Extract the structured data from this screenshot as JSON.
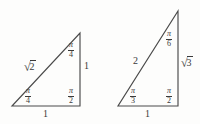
{
  "figure": {
    "background_color": "#fdfdfc",
    "stroke_color": "#4a4a4a",
    "text_color": "#3a3a3a"
  },
  "triangles": [
    {
      "name": "isosceles-right-triangle",
      "vertices": {
        "bottom_left": [
          12,
          106
        ],
        "bottom_right": [
          80,
          106
        ],
        "apex": [
          80,
          33
        ]
      },
      "angles": [
        {
          "name": "bottom-left-angle",
          "pi": "π",
          "denominator": "4"
        },
        {
          "name": "bottom-right-angle",
          "pi": "π",
          "denominator": "2"
        },
        {
          "name": "apex-angle",
          "pi": "π",
          "denominator": "4"
        }
      ],
      "sides": {
        "hypotenuse": {
          "surd": "√",
          "radicand": "2"
        },
        "vertical_leg": "1",
        "base": "1"
      }
    },
    {
      "name": "thirty-sixty-ninety-triangle",
      "vertices": {
        "bottom_left": [
          118,
          106
        ],
        "bottom_right": [
          178,
          106
        ],
        "apex": [
          178,
          11
        ]
      },
      "angles": [
        {
          "name": "bottom-left-angle",
          "pi": "π",
          "denominator": "3"
        },
        {
          "name": "bottom-right-angle",
          "pi": "π",
          "denominator": "2"
        },
        {
          "name": "apex-angle",
          "pi": "π",
          "denominator": "6"
        }
      ],
      "sides": {
        "hypotenuse": "2",
        "vertical_leg": {
          "surd": "√",
          "radicand": "3"
        },
        "base": "1"
      }
    }
  ]
}
